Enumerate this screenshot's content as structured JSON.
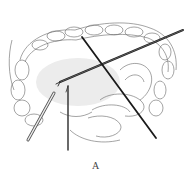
{
  "figure": {
    "caption_label": "A",
    "colors": {
      "line": "#555555",
      "instrument": "#1a1a1a",
      "shade": "#e6e6e6",
      "background": "#ffffff"
    }
  }
}
